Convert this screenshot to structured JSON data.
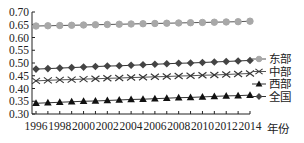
{
  "chart_data": {
    "type": "line",
    "title": "",
    "xlabel": "年份",
    "ylabel": "",
    "x": [
      1996,
      1997,
      1998,
      1999,
      2000,
      2001,
      2002,
      2003,
      2004,
      2005,
      2006,
      2007,
      2008,
      2009,
      2010,
      2011,
      2012,
      2013,
      2014
    ],
    "x_tick_labels": [
      "1996",
      "1998",
      "2000",
      "2002",
      "2004",
      "2006",
      "2008",
      "2010",
      "2012",
      "2014"
    ],
    "y_tick_labels": [
      "0.70",
      "0.65",
      "0.60",
      "0.55",
      "0.50",
      "0.45",
      "0.40",
      "0.35",
      "0.30"
    ],
    "ylim": [
      0.3,
      0.7
    ],
    "grid": false,
    "legend_position": "right",
    "series": [
      {
        "name": "东部",
        "marker": "circle",
        "color": "#a8a8a8",
        "line_color": "#555555",
        "values": [
          0.645,
          0.646,
          0.647,
          0.648,
          0.649,
          0.65,
          0.651,
          0.652,
          0.653,
          0.654,
          0.655,
          0.656,
          0.657,
          0.658,
          0.659,
          0.66,
          0.661,
          0.662,
          0.664
        ]
      },
      {
        "name": "中部",
        "marker": "x",
        "color": "#333333",
        "line_color": "#555555",
        "values": [
          0.43,
          0.432,
          0.434,
          0.435,
          0.437,
          0.438,
          0.44,
          0.441,
          0.443,
          0.444,
          0.446,
          0.447,
          0.449,
          0.45,
          0.452,
          0.453,
          0.455,
          0.457,
          0.459
        ]
      },
      {
        "name": "西部",
        "marker": "triangle",
        "color": "#111111",
        "line_color": "#333333",
        "values": [
          0.342,
          0.344,
          0.346,
          0.348,
          0.35,
          0.351,
          0.353,
          0.355,
          0.357,
          0.358,
          0.36,
          0.362,
          0.364,
          0.365,
          0.367,
          0.369,
          0.371,
          0.372,
          0.374
        ]
      },
      {
        "name": "全国",
        "marker": "diamond",
        "color": "#444444",
        "line_color": "#333333",
        "values": [
          0.476,
          0.478,
          0.48,
          0.482,
          0.484,
          0.486,
          0.488,
          0.489,
          0.491,
          0.493,
          0.495,
          0.497,
          0.499,
          0.5,
          0.502,
          0.504,
          0.506,
          0.508,
          0.51
        ]
      }
    ]
  },
  "legend": {
    "items": [
      {
        "label": "东部"
      },
      {
        "label": "中部"
      },
      {
        "label": "西部"
      },
      {
        "label": "全国"
      }
    ]
  },
  "axis": {
    "x_title": "年份"
  }
}
